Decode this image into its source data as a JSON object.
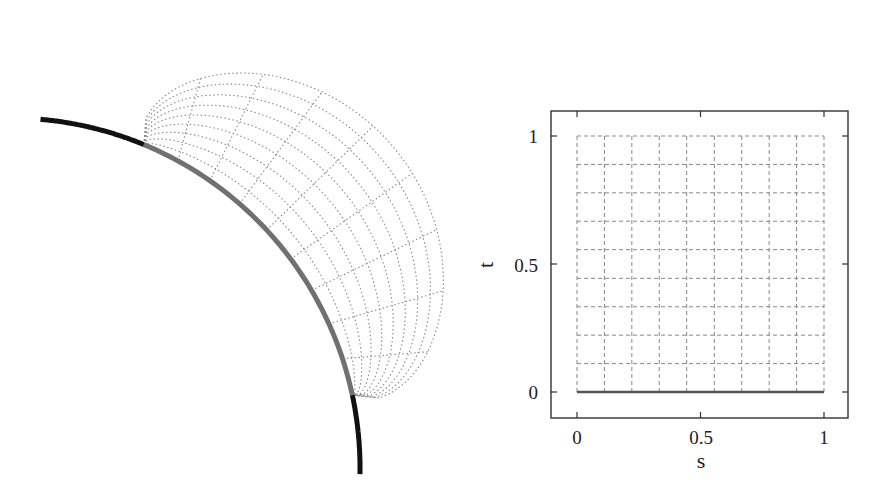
{
  "left_panel": {
    "description": "Physical-space mesh attached to a circular arc boundary",
    "base_arc": {
      "center": [
        10,
        468
      ],
      "radius": 350,
      "full_angle_range_deg": [
        85,
        -1
      ],
      "highlight_angle_range_deg": [
        67.5,
        12
      ],
      "outer_color": "#111111",
      "highlight_color": "#707070"
    },
    "mesh": {
      "s_lines": 10,
      "t_lines": 10,
      "color": "#8a8a8a",
      "style": "dotted"
    }
  },
  "chart_data": {
    "type": "line",
    "title": "",
    "xlabel": "s",
    "ylabel": "t",
    "xlim": [
      -0.1,
      1.1
    ],
    "ylim": [
      -0.1,
      1.1
    ],
    "xticks": [
      "0",
      "0.5",
      "1"
    ],
    "yticks": [
      "0",
      "0.5",
      "1"
    ],
    "grid": {
      "s_values": [
        0,
        0.111,
        0.222,
        0.333,
        0.444,
        0.556,
        0.667,
        0.778,
        0.889,
        1.0
      ],
      "t_values": [
        0,
        0.111,
        0.222,
        0.333,
        0.444,
        0.556,
        0.667,
        0.778,
        0.889,
        1.0
      ],
      "style": "dashed",
      "color": "#888888"
    },
    "series": [
      {
        "name": "boundary t=0",
        "x": [
          0,
          1
        ],
        "y": [
          0,
          0
        ],
        "style": "solid",
        "color": "#555555"
      }
    ],
    "legend": null
  },
  "labels": {
    "x_axis": "s",
    "y_axis": "t",
    "xtick_0": "0",
    "xtick_05": "0.5",
    "xtick_1": "1",
    "ytick_0": "0",
    "ytick_05": "0.5",
    "ytick_1": "1"
  }
}
